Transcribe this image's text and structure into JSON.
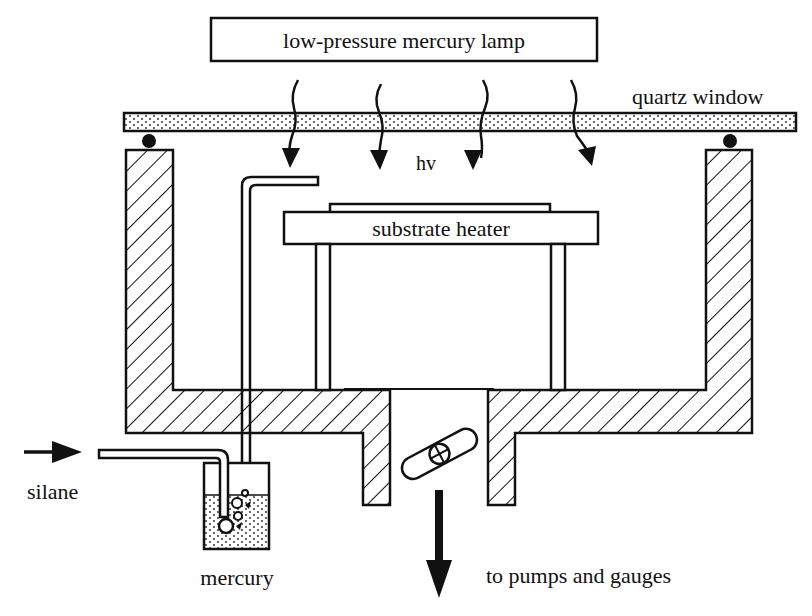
{
  "diagram": {
    "labels": {
      "lamp": "low-pressure mercury lamp",
      "window": "quartz window",
      "photon": "hv",
      "heater": "substrate heater",
      "gas_in": "silane",
      "bubbler": "mercury",
      "exhaust": "to pumps and gauges"
    },
    "components": [
      {
        "id": "lamp",
        "type": "box",
        "label": "low-pressure mercury lamp"
      },
      {
        "id": "quartz-window",
        "type": "stippled-plate",
        "label": "quartz window"
      },
      {
        "id": "o-rings",
        "type": "seal",
        "count": 2
      },
      {
        "id": "uv-rays",
        "type": "wavy-arrows",
        "count": 4,
        "label": "hv"
      },
      {
        "id": "chamber-walls",
        "type": "hatched-vessel"
      },
      {
        "id": "substrate-heater",
        "type": "box",
        "label": "substrate heater"
      },
      {
        "id": "heater-supports",
        "type": "legs",
        "count": 2
      },
      {
        "id": "gas-inlet-tube",
        "type": "tube"
      },
      {
        "id": "mercury-bubbler",
        "type": "stippled-container",
        "label": "mercury"
      },
      {
        "id": "throttle-valve",
        "type": "butterfly-valve"
      },
      {
        "id": "exhaust-port",
        "type": "outlet",
        "label": "to pumps and gauges"
      }
    ],
    "colors": {
      "ink": "#111111",
      "background": "#ffffff"
    }
  }
}
